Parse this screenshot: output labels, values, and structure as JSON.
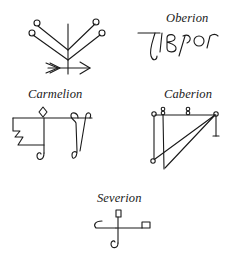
{
  "page": {
    "background": "#ffffff",
    "ink_color": "#1a1a1a"
  },
  "sigils": [
    {
      "id": "unlabeled",
      "label": "",
      "icon": "branching-tree-arrow-sigil"
    },
    {
      "id": "oberion",
      "label": "Oberion",
      "icon": "oberion-script-sigil"
    },
    {
      "id": "carmelion",
      "label": "Carmelion",
      "icon": "carmelion-sigil"
    },
    {
      "id": "caberion",
      "label": "Caberion",
      "icon": "caberion-sigil"
    },
    {
      "id": "severion",
      "label": "Severion",
      "icon": "severion-sigil"
    }
  ]
}
